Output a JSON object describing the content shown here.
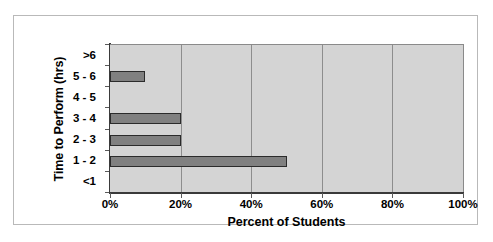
{
  "chart_data": {
    "type": "bar",
    "orientation": "horizontal",
    "title": "",
    "xlabel": "Percent of Students",
    "ylabel": "Time to Perform (hrs)",
    "categories": [
      ">6",
      "5 - 6",
      "4 - 5",
      "3 - 4",
      "2 - 3",
      "1 - 2",
      "<1"
    ],
    "values": [
      0,
      10,
      0,
      20,
      20,
      50,
      0
    ],
    "value_unit": "percent",
    "xlim": [
      0,
      100
    ],
    "xticks": [
      0,
      20,
      40,
      60,
      80,
      100
    ],
    "xtick_labels": [
      "0%",
      "20%",
      "40%",
      "60%",
      "80%",
      "100%"
    ],
    "grid": "vertical",
    "legend": "none",
    "series": [
      {
        "name": "Percent of Students",
        "values": [
          0,
          10,
          0,
          20,
          20,
          50,
          0
        ]
      }
    ]
  },
  "style": {
    "plot_background": "#d4d4d4",
    "figure_background": "#ffffff",
    "bar_fill": "#808080",
    "bar_border": "#2b2b2b",
    "gridline_color": "#8d8d8d",
    "axis_color": "#3a3a3a",
    "frame_border": "#b9b9b9",
    "text_color": "#000000"
  }
}
